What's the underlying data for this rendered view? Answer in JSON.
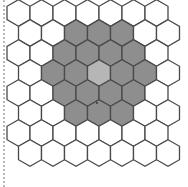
{
  "diagram": {
    "type": "hex-grid",
    "orientation": "pointy-top",
    "rows": 8,
    "cols": 7,
    "hex_width": 23,
    "hex_side": 13.3,
    "row_step": 20,
    "origin_x": 18.5,
    "origin_y": 13,
    "odd_row_offset": 11.5,
    "colors": {
      "stroke": "#4a4a4a",
      "empty_fill": "#ffffff",
      "ring_fill": "#8e8e8e",
      "center_fill": "#b6b6b6"
    },
    "highlight": {
      "center": {
        "row": 3,
        "col": 3
      },
      "ring_cells": [
        {
          "row": 1,
          "col": 2
        },
        {
          "row": 1,
          "col": 3
        },
        {
          "row": 1,
          "col": 4
        },
        {
          "row": 2,
          "col": 2
        },
        {
          "row": 2,
          "col": 3
        },
        {
          "row": 2,
          "col": 4
        },
        {
          "row": 2,
          "col": 5
        },
        {
          "row": 3,
          "col": 1
        },
        {
          "row": 3,
          "col": 2
        },
        {
          "row": 3,
          "col": 4
        },
        {
          "row": 3,
          "col": 5
        },
        {
          "row": 4,
          "col": 2
        },
        {
          "row": 4,
          "col": 3
        },
        {
          "row": 4,
          "col": 4
        },
        {
          "row": 4,
          "col": 5
        },
        {
          "row": 5,
          "col": 2
        },
        {
          "row": 5,
          "col": 3
        },
        {
          "row": 5,
          "col": 4
        }
      ]
    },
    "markers": [
      {
        "x": 97,
        "y": 103,
        "label": "dot"
      }
    ]
  }
}
